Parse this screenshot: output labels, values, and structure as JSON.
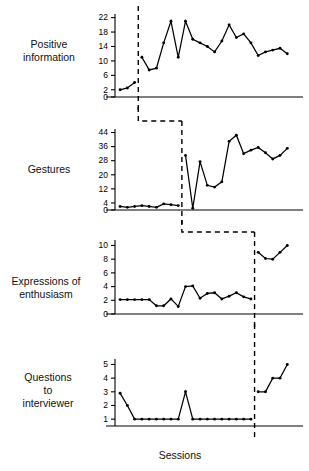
{
  "figure": {
    "type": "multiple-baseline-line-chart",
    "xlabel": "Sessions",
    "panel_labels": [
      "Positive\ninformation",
      "Gestures",
      "Expressions of\nenthusiasm",
      "Questions\nto\ninterviewer"
    ]
  },
  "chart_data": {
    "type": "line",
    "title": "",
    "xlabel": "Sessions",
    "ylabel": "",
    "grid": false,
    "legend": "none",
    "panels": [
      {
        "name": "Positive information",
        "ylabel": "Positive information",
        "ylim": [
          0,
          23
        ],
        "yticks": [
          0,
          2,
          6,
          10,
          14,
          18,
          22
        ],
        "phase_change_session": 3.5,
        "series": [
          {
            "name": "baseline",
            "x": [
              1,
              2,
              3
            ],
            "values": [
              2,
              2.5,
              4
            ]
          },
          {
            "name": "intervention",
            "x": [
              4,
              5,
              6,
              7,
              8,
              9,
              10,
              11,
              12,
              13,
              14,
              15,
              16,
              17,
              18,
              19,
              20,
              21,
              22,
              23,
              24
            ],
            "values": [
              11,
              7.5,
              8,
              15,
              21,
              11,
              21,
              16,
              15,
              14,
              12.5,
              15.5,
              20,
              16.5,
              17.5,
              15,
              11.5,
              12.5,
              13,
              13.5,
              12
            ]
          }
        ]
      },
      {
        "name": "Gestures",
        "ylabel": "Gestures",
        "ylim": [
          0,
          46
        ],
        "yticks": [
          0,
          4,
          12,
          20,
          28,
          36,
          44
        ],
        "phase_change_session": 9.5,
        "series": [
          {
            "name": "baseline",
            "x": [
              1,
              2,
              3,
              4,
              5,
              6,
              7,
              8,
              9
            ],
            "values": [
              2,
              1.5,
              2,
              2.5,
              2,
              1.5,
              3.5,
              3,
              2.5
            ]
          },
          {
            "name": "intervention",
            "x": [
              10,
              11,
              12,
              13,
              14,
              15,
              16,
              17,
              18,
              19,
              20,
              21,
              22,
              23,
              24
            ],
            "values": [
              31,
              1,
              27.5,
              14,
              13,
              16,
              39,
              42.5,
              32,
              34,
              35.5,
              32.5,
              29,
              31,
              35
            ]
          }
        ]
      },
      {
        "name": "Expressions of enthusiasm",
        "ylabel": "Expressions of enthusiasm",
        "ylim": [
          0,
          10.8
        ],
        "yticks": [
          0,
          2,
          4,
          6,
          8,
          10
        ],
        "phase_change_session": 19.5,
        "series": [
          {
            "name": "baseline",
            "x": [
              1,
              2,
              3,
              4,
              5,
              6,
              7,
              8,
              9,
              10,
              11,
              12,
              13,
              14,
              15,
              16,
              17,
              18,
              19
            ],
            "values": [
              2.1,
              2.1,
              2.1,
              2.1,
              2.1,
              1.2,
              1.2,
              2.2,
              1.1,
              4,
              4.1,
              2.3,
              3,
              3.1,
              2.2,
              2.6,
              3.1,
              2.5,
              2.2
            ]
          },
          {
            "name": "intervention",
            "x": [
              20,
              21,
              22,
              23,
              24
            ],
            "values": [
              9,
              8.1,
              8,
              9,
              10
            ]
          }
        ]
      },
      {
        "name": "Questions to interviewer",
        "ylabel": "Questions to interviewer",
        "ylim": [
          0.5,
          5.4
        ],
        "yticks": [
          1,
          2,
          3,
          4,
          5
        ],
        "phase_change_session": 19.5,
        "series": [
          {
            "name": "baseline",
            "x": [
              1,
              2,
              3,
              4,
              5,
              6,
              7,
              8,
              9,
              10,
              11,
              12,
              13,
              14,
              15,
              16,
              17,
              18,
              19
            ],
            "values": [
              2.9,
              2,
              1,
              1,
              1,
              1,
              1,
              1,
              1,
              3,
              1,
              1,
              1,
              1,
              1,
              1,
              1,
              1,
              1
            ]
          },
          {
            "name": "intervention",
            "x": [
              20,
              21,
              22,
              23,
              24
            ],
            "values": [
              3,
              3,
              4,
              4,
              5
            ]
          }
        ]
      }
    ]
  }
}
